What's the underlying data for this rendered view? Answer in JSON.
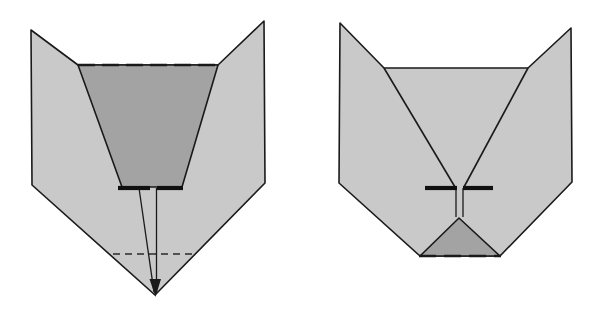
{
  "figure": {
    "canvas": {
      "width": 594,
      "height": 321,
      "background": "#ffffff"
    },
    "colors": {
      "body_fill": "#c9c9c9",
      "core_fill": "#a3a3a3",
      "outline": "#1a1a1a",
      "dash": "#1a1a1a",
      "background": "#ffffff"
    },
    "stroke_widths": {
      "outline": 1.6,
      "thin": 1.2,
      "bar": 4.0,
      "dash": 2.2,
      "dot": 1.6
    },
    "panels": [
      {
        "name": "left-panel",
        "label": "left-figure",
        "shapes": {
          "body_outline": "31,30 78,65 218,65 264,21 265,183 155,295 32,185",
          "core_funnel": "78,65 218,65 182,187 122,187",
          "left_wing_edge": "31,30 78,65",
          "right_wing_edge": "264,21 218,65",
          "top_dashed": {
            "x1": 78,
            "y1": 65,
            "x2": 218,
            "y2": 65
          },
          "bar_left": {
            "x1": 118,
            "y1": 188,
            "x2": 150,
            "y2": 188
          },
          "bar_right": {
            "x1": 156,
            "y1": 188,
            "x2": 183,
            "y2": 188
          },
          "stem_left": "139,188 155,294",
          "stem_right": "156,188 156,294",
          "apex_marker": "150,280 155,296 161,280",
          "dotted_line": {
            "x1": 113,
            "y1": 254,
            "x2": 197,
            "y2": 254
          }
        }
      },
      {
        "name": "right-panel",
        "label": "right-figure",
        "shapes": {
          "body_outline": "340,23 384,68 528,68 571,28 572,182 500,256 420,256 339,183",
          "left_inner_edge": "384,68 452,187",
          "right_inner_edge": "528,68 466,187",
          "core_triangle": "459,218 500,256 420,256",
          "bar_left": {
            "x1": 425,
            "y1": 188,
            "x2": 456,
            "y2": 188
          },
          "bar_right": {
            "x1": 463,
            "y1": 188,
            "x2": 493,
            "y2": 188
          },
          "channel_left": "456,188 456,216",
          "channel_right": "463,188 463,216",
          "bottom_dashed": {
            "x1": 420,
            "y1": 256,
            "x2": 500,
            "y2": 256
          }
        }
      }
    ]
  }
}
